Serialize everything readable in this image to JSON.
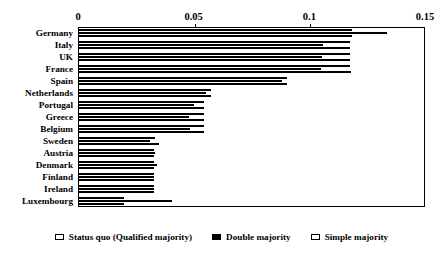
{
  "chart_data": {
    "type": "bar",
    "orientation": "horizontal",
    "title": "",
    "xlabel": "",
    "ylabel": "",
    "xlim": [
      0,
      0.15
    ],
    "xticks": [
      0,
      0.05,
      0.1,
      0.15
    ],
    "xtick_labels": [
      "0",
      "0.05",
      "0.1",
      "0.15"
    ],
    "grid": false,
    "legend_position": "bottom",
    "categories": [
      "Germany",
      "Italy",
      "UK",
      "France",
      "Spain",
      "Netherlands",
      "Portugal",
      "Greece",
      "Belgium",
      "Sweden",
      "Austria",
      "Denmark",
      "Finland",
      "Ireland",
      "Luxembourg"
    ],
    "series": [
      {
        "name": "Status quo (Qualified majority)",
        "style": "open",
        "values": [
          0.1185,
          0.1175,
          0.1175,
          0.1175,
          0.0905,
          0.0575,
          0.0545,
          0.0545,
          0.0545,
          0.0335,
          0.033,
          0.033,
          0.033,
          0.033,
          0.0198
        ]
      },
      {
        "name": "Double majority",
        "style": "filled",
        "values": [
          0.1335,
          0.106,
          0.1055,
          0.105,
          0.088,
          0.0555,
          0.05,
          0.048,
          0.0485,
          0.031,
          0.0335,
          0.0342,
          0.033,
          0.033,
          0.0405
        ]
      },
      {
        "name": "Simple majority",
        "style": "open",
        "values": [
          0.1185,
          0.1175,
          0.1175,
          0.118,
          0.0905,
          0.0575,
          0.0545,
          0.0545,
          0.0545,
          0.0348,
          0.033,
          0.033,
          0.033,
          0.033,
          0.0198
        ]
      }
    ]
  },
  "legend": {
    "items": [
      {
        "label": "Status quo (Qualified majority)",
        "style": "open"
      },
      {
        "label": "Double majority",
        "style": "filled"
      },
      {
        "label": "Simple majority",
        "style": "open"
      }
    ]
  }
}
